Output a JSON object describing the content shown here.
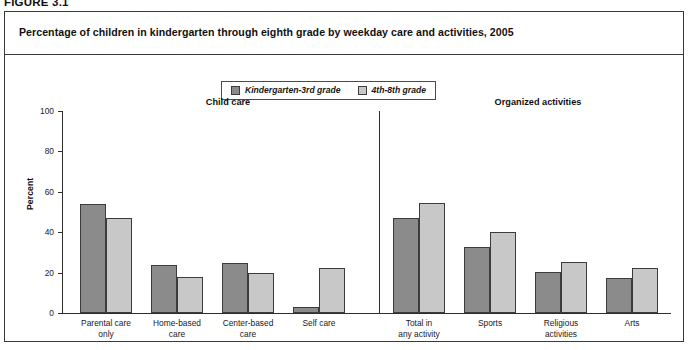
{
  "figure": {
    "number": "FIGURE 3.1",
    "title": "Percentage of children in kindergarten through eighth grade by weekday care and activities, 2005"
  },
  "legend": {
    "position": "top-center",
    "items": [
      {
        "label": "Kindergarten-3rd grade",
        "color": "#8b8b8b",
        "swatch": "dark-swatch"
      },
      {
        "label": "4th-8th grade",
        "color": "#c8c8c8",
        "swatch": "light-swatch"
      }
    ]
  },
  "axes": {
    "ylabel": "Percent",
    "yticks": [
      0,
      20,
      40,
      60,
      80,
      100
    ],
    "ylim": [
      0,
      100
    ],
    "grid": false
  },
  "sections": [
    {
      "id": "child-care",
      "label": "Child care"
    },
    {
      "id": "organized-activities",
      "label": "Organized activities"
    }
  ],
  "source_note": "",
  "chart_data": {
    "type": "bar",
    "title": "Percentage of children in kindergarten through eighth grade by weekday care and activities, 2005",
    "xlabel": "",
    "ylabel": "Percent",
    "ylim": [
      0,
      100
    ],
    "yticks": [
      0,
      20,
      40,
      60,
      80,
      100
    ],
    "grid": false,
    "legend_position": "top-center",
    "categories": [
      "Parental care only",
      "Home-based care",
      "Center-based care",
      "Self care",
      "Total in any activity",
      "Sports",
      "Religious activities",
      "Arts"
    ],
    "category_lines": [
      [
        "Parental care",
        "only"
      ],
      [
        "Home-based",
        "care"
      ],
      [
        "Center-based",
        "care"
      ],
      [
        "Self care"
      ],
      [
        "Total in",
        "any activity"
      ],
      [
        "Sports"
      ],
      [
        "Religious",
        "activities"
      ],
      [
        "Arts"
      ]
    ],
    "category_groups": [
      "Child care",
      "Child care",
      "Child care",
      "Child care",
      "Organized activities",
      "Organized activities",
      "Organized activities",
      "Organized activities"
    ],
    "series": [
      {
        "name": "Kindergarten-3rd grade",
        "color": "#8b8b8b",
        "values": [
          54,
          24,
          25,
          3,
          47,
          32.5,
          20.5,
          17.5
        ]
      },
      {
        "name": "4th-8th grade",
        "color": "#c8c8c8",
        "values": [
          47,
          18,
          20,
          22.5,
          54.5,
          40,
          25.5,
          22.5
        ]
      }
    ]
  }
}
